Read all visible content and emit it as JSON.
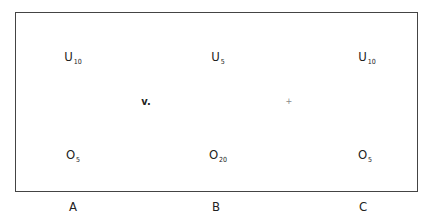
{
  "diagram": {
    "top_row": [
      {
        "base": "U",
        "sub": "10"
      },
      {
        "base": "U",
        "sub": "5"
      },
      {
        "base": "U",
        "sub": "10"
      }
    ],
    "bottom_row": [
      {
        "base": "O",
        "sub": "5"
      },
      {
        "base": "O",
        "sub": "20"
      },
      {
        "base": "O",
        "sub": "5"
      }
    ],
    "operators": [
      {
        "symbol": "v.",
        "name": "versus"
      },
      {
        "symbol": "+",
        "name": "plus"
      }
    ],
    "columns": [
      "A",
      "B",
      "C"
    ]
  }
}
